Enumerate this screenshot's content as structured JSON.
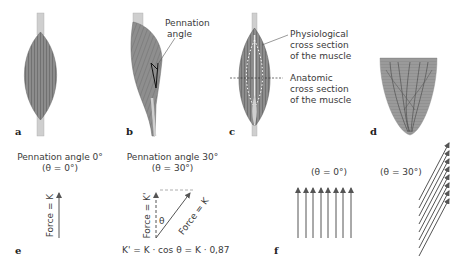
{
  "panels": {
    "a": {
      "letter": "a"
    },
    "b": {
      "letter": "b",
      "label": [
        "Pennation",
        "angle"
      ]
    },
    "c": {
      "letter": "c",
      "label_physio": [
        "Physiological",
        "cross section",
        "of the muscle"
      ],
      "label_anat": [
        "Anatomic",
        "cross section",
        "of the muscle"
      ]
    },
    "d": {
      "letter": "d"
    },
    "e": {
      "letter": "e",
      "left_title": "Pennation angle 0°",
      "left_sub": "(θ = 0°)",
      "left_force": "Force = K",
      "right_title": "Pennation angle 30°",
      "right_sub": "(θ = 30°)",
      "right_force_v": "Force = K'",
      "right_force_d": "Force = K",
      "theta": "θ",
      "formula": "K' = K · cos θ = K · 0,87"
    },
    "f": {
      "letter": "f",
      "left_sub": "(θ = 0°)",
      "right_sub": "(θ = 30°)",
      "arrow_count": 8
    }
  },
  "colors": {
    "muscle": "#8a8a8a",
    "muscle_dark": "#6e6e6e",
    "tendon": "#cfcfcf",
    "arrow": "#555555"
  }
}
